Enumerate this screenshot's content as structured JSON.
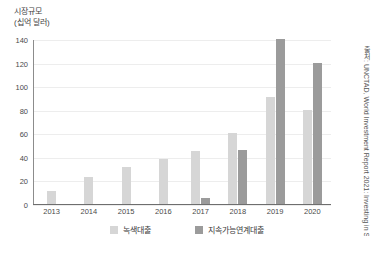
{
  "chart_data": {
    "type": "bar",
    "title": "",
    "ylabel": "시장규모\n(십억 달러)",
    "ylabel_line1": "시장규모",
    "ylabel_line2": "(십억 달러)",
    "xlabel": "",
    "categories": [
      "2013",
      "2014",
      "2015",
      "2016",
      "2017",
      "2018",
      "2019",
      "2020"
    ],
    "series": [
      {
        "name": "녹색대출",
        "color": "#d6d6d6",
        "values": [
          11,
          23,
          31,
          38,
          45,
          60,
          91,
          80
        ]
      },
      {
        "name": "지속가능연계대출",
        "color": "#9b9b9b",
        "values": [
          0,
          0,
          0,
          0,
          5,
          46,
          140,
          120
        ]
      }
    ],
    "ylim": [
      0,
      140
    ],
    "yticks": [
      0,
      20,
      40,
      60,
      80,
      100,
      120,
      140
    ],
    "grid": true,
    "legend_position": "bottom",
    "annotations": [
      "출처: UNCTAD, World Investment Report 2021: Investing in Sustainable Recovery, 2021, p.222"
    ]
  },
  "source_note": "출처: UNCTAD, World Investment Report 2021: Investing in Sustainable Recovery, 2021, p.222"
}
